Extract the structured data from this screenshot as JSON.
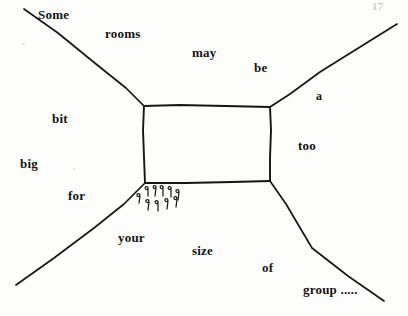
{
  "diagram": {
    "type": "hand-drawn-sketch",
    "caption_sentence": "Some rooms may be a bit too big for your size of group .....",
    "ink_color": "#141414",
    "paper_color": "#fdfdfc",
    "page_corner_mark": "17",
    "labels": [
      {
        "id": "some",
        "text": "Some",
        "x": 38,
        "y": 8,
        "size": 13
      },
      {
        "id": "rooms",
        "text": "rooms",
        "x": 105,
        "y": 27,
        "size": 13
      },
      {
        "id": "may",
        "text": "may",
        "x": 192,
        "y": 46,
        "size": 13
      },
      {
        "id": "be",
        "text": "be",
        "x": 254,
        "y": 61,
        "size": 13
      },
      {
        "id": "a",
        "text": "a",
        "x": 316,
        "y": 90,
        "size": 12
      },
      {
        "id": "bit",
        "text": "bit",
        "x": 52,
        "y": 112,
        "size": 13
      },
      {
        "id": "too",
        "text": "too",
        "x": 298,
        "y": 139,
        "size": 13
      },
      {
        "id": "big",
        "text": "big",
        "x": 20,
        "y": 157,
        "size": 13
      },
      {
        "id": "for",
        "text": "for",
        "x": 68,
        "y": 189,
        "size": 13
      },
      {
        "id": "your",
        "text": "your",
        "x": 118,
        "y": 231,
        "size": 13
      },
      {
        "id": "size",
        "text": "size",
        "x": 192,
        "y": 244,
        "size": 13
      },
      {
        "id": "of",
        "text": "of",
        "x": 262,
        "y": 261,
        "size": 13
      },
      {
        "id": "group",
        "text": "group .....",
        "x": 303,
        "y": 283,
        "size": 13
      }
    ],
    "shapes": {
      "room_box": {
        "name": "central-room-rectangle",
        "top_left": [
          144,
          106
        ],
        "top_right": [
          270,
          107
        ],
        "bottom_right": [
          270,
          181
        ],
        "bottom_left": [
          145,
          183
        ]
      },
      "corner_lines": [
        {
          "name": "upper-left-wall-line",
          "from": [
            24,
            9
          ],
          "to": [
            144,
            106
          ]
        },
        {
          "name": "upper-right-wall-line",
          "from": [
            397,
            24
          ],
          "to": [
            270,
            107
          ]
        },
        {
          "name": "lower-left-wall-line",
          "from": [
            16,
            285
          ],
          "to": [
            145,
            183
          ]
        },
        {
          "name": "lower-right-wall-line",
          "from": [
            384,
            301
          ],
          "to": [
            270,
            181
          ]
        }
      ],
      "pin_cluster": {
        "name": "people-pin-marks",
        "count": 10,
        "description": "cluster of small hook/pin marks below the box's lower-left corner"
      }
    }
  }
}
